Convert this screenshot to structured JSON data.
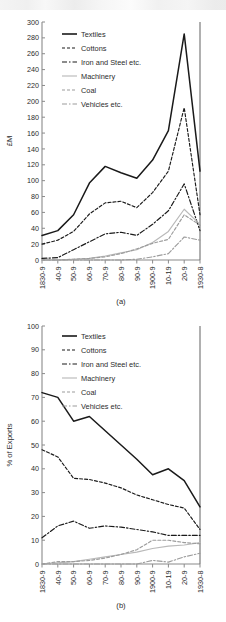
{
  "figure": {
    "panels": [
      {
        "id": "a",
        "caption": "(a)",
        "ylabel": "£M",
        "legend_title": ""
      },
      {
        "id": "b",
        "caption": "(b)",
        "ylabel": "% of Exports",
        "legend_title": ""
      }
    ]
  },
  "legend": {
    "items": [
      {
        "label": "Textiles",
        "style": "solid",
        "color": "#1a1a1a"
      },
      {
        "label": "Cottons",
        "style": "dashed",
        "color": "#1a1a1a"
      },
      {
        "label": "Iron and Steel etc.",
        "style": "dashdot",
        "color": "#1a1a1a"
      },
      {
        "label": "Machinery",
        "style": "solid",
        "color": "#b9b9b9"
      },
      {
        "label": "Coal",
        "style": "dashed",
        "color": "#9c9c9c"
      },
      {
        "label": "Vehicles etc.",
        "style": "dashdot",
        "color": "#9c9c9c"
      }
    ]
  },
  "chart_data": [
    {
      "type": "line",
      "panel": "a",
      "title": "",
      "xlabel": "",
      "ylabel": "£M",
      "categories": [
        "1830-9",
        "40-9",
        "50-9",
        "60-9",
        "70-9",
        "80-9",
        "90-9",
        "1900-9",
        "10-19",
        "20-9",
        "1930-8"
      ],
      "ylim": [
        0,
        300
      ],
      "ytick_step": 20,
      "yticks": [
        0,
        20,
        40,
        60,
        80,
        100,
        120,
        140,
        160,
        180,
        200,
        220,
        240,
        260,
        280,
        300
      ],
      "grid": false,
      "legend_position": "top-left",
      "series": [
        {
          "name": "Textiles",
          "style": "solid",
          "color": "#1a1a1a",
          "values": [
            31,
            37,
            57,
            97,
            118,
            110,
            103,
            126,
            163,
            285,
            112
          ]
        },
        {
          "name": "Cottons",
          "style": "dashed",
          "color": "#1a1a1a",
          "values": [
            20,
            25,
            36,
            58,
            72,
            74,
            66,
            85,
            112,
            192,
            57
          ]
        },
        {
          "name": "Iron and Steel etc.",
          "style": "dashdot",
          "color": "#1a1a1a",
          "values": [
            2,
            3,
            13,
            23,
            33,
            35,
            31,
            45,
            62,
            96,
            37
          ]
        },
        {
          "name": "Machinery",
          "style": "solid",
          "color": "#b9b9b9",
          "values": [
            0,
            0,
            1,
            2,
            5,
            9,
            13,
            22,
            36,
            64,
            45
          ]
        },
        {
          "name": "Coal",
          "style": "dashed",
          "color": "#9c9c9c",
          "values": [
            0,
            0,
            1,
            2,
            4,
            8,
            14,
            21,
            26,
            57,
            44
          ]
        },
        {
          "name": "Vehicles etc.",
          "style": "dashdot",
          "color": "#9c9c9c",
          "values": [
            0,
            0,
            0,
            0,
            0,
            0,
            1,
            4,
            8,
            29,
            25
          ]
        }
      ]
    },
    {
      "type": "line",
      "panel": "b",
      "title": "",
      "xlabel": "",
      "ylabel": "% of Exports",
      "categories": [
        "1830-9",
        "40-9",
        "50-9",
        "60-9",
        "70-9",
        "80-9",
        "90-9",
        "1900-9",
        "10-19",
        "20-9",
        "1930-8"
      ],
      "ylim": [
        0,
        100
      ],
      "ytick_step": 10,
      "yticks": [
        0,
        10,
        20,
        30,
        40,
        50,
        60,
        70,
        80,
        90,
        100
      ],
      "grid": false,
      "legend_position": "top-left",
      "series": [
        {
          "name": "Textiles",
          "style": "solid",
          "color": "#1a1a1a",
          "values": [
            72,
            70,
            60,
            62,
            56,
            50,
            44,
            37.5,
            40,
            35,
            24
          ]
        },
        {
          "name": "Cottons",
          "style": "dashed",
          "color": "#1a1a1a",
          "values": [
            48,
            45,
            36,
            35.5,
            34,
            32,
            29,
            27,
            25,
            23.5,
            14.5
          ]
        },
        {
          "name": "Iron and Steel etc.",
          "style": "dashdot",
          "color": "#1a1a1a",
          "values": [
            11,
            16,
            18,
            15,
            16,
            15.5,
            14.5,
            13.5,
            12,
            12,
            12
          ]
        },
        {
          "name": "Machinery",
          "style": "solid",
          "color": "#b9b9b9",
          "values": [
            0,
            0.5,
            1,
            2,
            3,
            4,
            5,
            6.5,
            7.5,
            8,
            9
          ]
        },
        {
          "name": "Coal",
          "style": "dashed",
          "color": "#9c9c9c",
          "values": [
            0,
            1,
            1,
            1.5,
            2.5,
            4,
            6,
            10,
            10,
            9,
            8.5
          ]
        },
        {
          "name": "Vehicles etc.",
          "style": "dashdot",
          "color": "#9c9c9c",
          "values": [
            0,
            0,
            0,
            0,
            0,
            0,
            0,
            1.5,
            0.8,
            3,
            4.5
          ]
        }
      ]
    }
  ]
}
